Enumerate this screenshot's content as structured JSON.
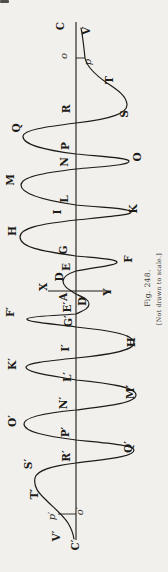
{
  "figure": {
    "caption": "Fig. 248.",
    "note": "[Not drawn to scale.]",
    "paper_color": "#f1f0ec",
    "ink_color": "#1d1b18",
    "labels": [
      {
        "text": "C",
        "x": 60,
        "y": 26,
        "style": "cap"
      },
      {
        "text": "V",
        "x": 86,
        "y": 31,
        "style": "cap"
      },
      {
        "text": "o",
        "x": 64,
        "y": 56,
        "style": "lower"
      },
      {
        "text": "p",
        "x": 88,
        "y": 62,
        "style": "lower"
      },
      {
        "text": "T",
        "x": 109,
        "y": 80,
        "style": "cap"
      },
      {
        "text": "S",
        "x": 124,
        "y": 114,
        "style": "cap"
      },
      {
        "text": "R",
        "x": 66,
        "y": 109,
        "style": "cap"
      },
      {
        "text": "Q",
        "x": 16,
        "y": 128,
        "style": "cap"
      },
      {
        "text": "P",
        "x": 65,
        "y": 146,
        "style": "cap"
      },
      {
        "text": "O",
        "x": 137,
        "y": 157,
        "style": "cap"
      },
      {
        "text": "N",
        "x": 64,
        "y": 162,
        "style": "cap"
      },
      {
        "text": "M",
        "x": 10,
        "y": 180,
        "style": "cap"
      },
      {
        "text": "L",
        "x": 64,
        "y": 199,
        "style": "cap"
      },
      {
        "text": "K",
        "x": 133,
        "y": 209,
        "style": "cap"
      },
      {
        "text": "I",
        "x": 57,
        "y": 212,
        "style": "cap"
      },
      {
        "text": "H",
        "x": 12,
        "y": 231,
        "style": "cap"
      },
      {
        "text": "G",
        "x": 63,
        "y": 250,
        "style": "cap"
      },
      {
        "text": "F",
        "x": 128,
        "y": 259,
        "style": "cap"
      },
      {
        "text": "E",
        "x": 66,
        "y": 267,
        "style": "cap"
      },
      {
        "text": "D",
        "x": 59,
        "y": 277,
        "style": "cap"
      },
      {
        "text": "X",
        "x": 43,
        "y": 287,
        "style": "cap"
      },
      {
        "text": "Y",
        "x": 107,
        "y": 292,
        "style": "cap"
      },
      {
        "text": "A",
        "x": 63,
        "y": 297,
        "style": "cap"
      },
      {
        "text": "D′",
        "x": 82,
        "y": 300,
        "style": "cap"
      },
      {
        "text": "E′",
        "x": 67,
        "y": 307,
        "style": "cap"
      },
      {
        "text": "F′",
        "x": 10,
        "y": 312,
        "style": "cap"
      },
      {
        "text": "G′",
        "x": 68,
        "y": 321,
        "style": "cap"
      },
      {
        "text": "H′",
        "x": 131,
        "y": 341,
        "style": "cap"
      },
      {
        "text": "I′",
        "x": 65,
        "y": 348,
        "style": "cap"
      },
      {
        "text": "K′",
        "x": 12,
        "y": 364,
        "style": "cap"
      },
      {
        "text": "L′",
        "x": 67,
        "y": 377,
        "style": "cap"
      },
      {
        "text": "M′",
        "x": 130,
        "y": 392,
        "style": "cap"
      },
      {
        "text": "N′",
        "x": 63,
        "y": 403,
        "style": "cap"
      },
      {
        "text": "O′",
        "x": 12,
        "y": 421,
        "style": "cap"
      },
      {
        "text": "P′",
        "x": 65,
        "y": 432,
        "style": "cap"
      },
      {
        "text": "Q′",
        "x": 128,
        "y": 447,
        "style": "cap"
      },
      {
        "text": "R′",
        "x": 66,
        "y": 456,
        "style": "cap"
      },
      {
        "text": "S′",
        "x": 28,
        "y": 464,
        "style": "cap"
      },
      {
        "text": "T′",
        "x": 34,
        "y": 494,
        "style": "cap"
      },
      {
        "text": "p′",
        "x": 52,
        "y": 516,
        "style": "lower"
      },
      {
        "text": "o′",
        "x": 80,
        "y": 511,
        "style": "lower"
      },
      {
        "text": "V′",
        "x": 56,
        "y": 536,
        "style": "cap"
      },
      {
        "text": "C′",
        "x": 75,
        "y": 545,
        "style": "cap"
      }
    ]
  }
}
